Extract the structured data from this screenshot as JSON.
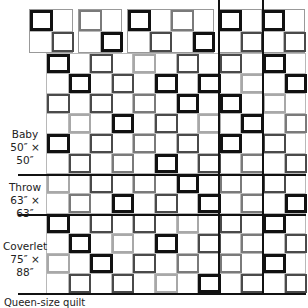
{
  "diagram": {
    "type": "quilt-layout",
    "grid": {
      "cols": 12,
      "rows": 12,
      "left": 46,
      "top": 53,
      "cell_w": 21.6,
      "cell_h": 20
    },
    "shades": {
      "K": "#111111",
      "D": "#4a4a4a",
      "M": "#7a7a7a",
      "L": "#a8a8a8"
    },
    "main_rows": [
      [
        "K",
        "D",
        "L",
        "D",
        "D",
        "K"
      ],
      [
        "K",
        "D",
        "K",
        "K",
        "L",
        "K"
      ],
      [
        "D",
        "D",
        "M",
        "K",
        "K",
        "L"
      ],
      [
        "L",
        "K",
        "D",
        "L",
        "K",
        "M"
      ],
      [
        "K",
        "D",
        "M",
        "D",
        "K",
        "D"
      ],
      [
        "D",
        "M",
        "K",
        "D",
        "M",
        "D"
      ],
      [
        "L",
        "D",
        "M",
        "K",
        "M",
        "D"
      ],
      [
        "M",
        "K",
        "D",
        "K",
        "M",
        "K"
      ],
      [
        "K",
        "D",
        "D",
        "L",
        "D",
        "K"
      ],
      [
        "K",
        "L",
        "K",
        "D",
        "M",
        "D"
      ],
      [
        "L",
        "K",
        "D",
        "M",
        "M",
        "K"
      ],
      [
        "D",
        "D",
        "L",
        "K",
        "D",
        "D"
      ]
    ],
    "top_blocks": [
      {
        "name": "block-a",
        "left": 29,
        "cols": 2,
        "frames": [
          {
            "r": 0,
            "c": 0,
            "s": "K"
          },
          {
            "r": 1,
            "c": 1,
            "s": "D"
          }
        ]
      },
      {
        "name": "block-b",
        "left": 78,
        "cols": 2,
        "frames": [
          {
            "r": 0,
            "c": 0,
            "s": "M"
          },
          {
            "r": 1,
            "c": 1,
            "s": "K"
          }
        ]
      },
      {
        "name": "block-c",
        "left": 127,
        "cols": 4,
        "frames": [
          {
            "r": 0,
            "c": 0,
            "s": "K"
          },
          {
            "r": 0,
            "c": 2,
            "s": "M"
          },
          {
            "r": 1,
            "c": 1,
            "s": "D"
          },
          {
            "r": 1,
            "c": 3,
            "s": "K"
          }
        ]
      },
      {
        "name": "block-d",
        "left": 218,
        "cols": 4,
        "frames": [
          {
            "r": 0,
            "c": 0,
            "s": "K"
          },
          {
            "r": 0,
            "c": 2,
            "s": "K"
          },
          {
            "r": 1,
            "c": 1,
            "s": "D"
          },
          {
            "r": 1,
            "c": 3,
            "s": "D"
          }
        ]
      }
    ],
    "size_labels": [
      {
        "name": "Baby",
        "dims": "50″ × 50″",
        "top": 128
      },
      {
        "name": "Throw",
        "dims": "63″ × 63″",
        "top": 181
      },
      {
        "name": "Coverlet",
        "dims": "75″ × 88″",
        "top": 240
      }
    ],
    "separators": {
      "horizontal_y": [
        174,
        214,
        293
      ],
      "vertical_x": [
        218,
        262
      ]
    },
    "caption": "Queen-size quilt"
  }
}
